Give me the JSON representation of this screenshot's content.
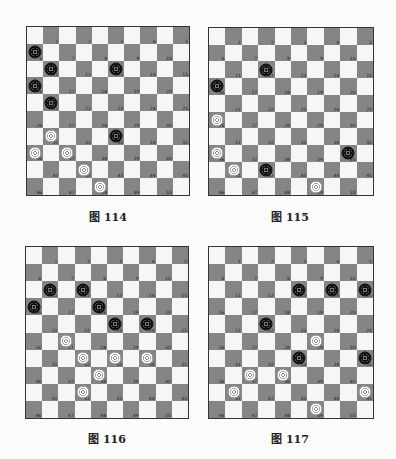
{
  "boards": [
    {
      "caption": "图 114",
      "black": [
        6,
        11,
        13,
        16,
        21,
        33
      ],
      "white": [
        31,
        36,
        37,
        42,
        48
      ]
    },
    {
      "caption": "图 115",
      "black": [
        12,
        16,
        40,
        42
      ],
      "white": [
        26,
        36,
        41,
        49
      ]
    },
    {
      "caption": "图 116",
      "black": [
        11,
        12,
        16,
        18,
        23,
        24
      ],
      "white": [
        27,
        32,
        33,
        34,
        38,
        42
      ]
    },
    {
      "caption": "图 117",
      "black": [
        13,
        14,
        15,
        22,
        33,
        35
      ],
      "white": [
        29,
        37,
        38,
        41,
        45,
        49
      ]
    }
  ],
  "colors": {
    "dark_square": "#858585",
    "light_square": "#f6f6f6",
    "black_piece": "#111111",
    "white_piece": "#ffffff"
  },
  "board_size": 10
}
